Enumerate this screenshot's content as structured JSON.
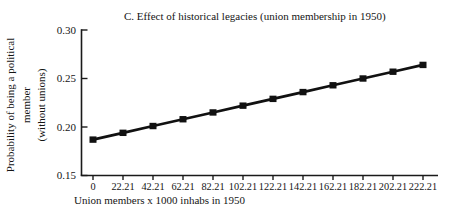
{
  "chart_data": {
    "type": "line",
    "title": "C. Effect of historical legacies (union membership in 1950)",
    "xlabel": "Union members x 1000 inhabs in 1950",
    "ylabel": "Probability of being a political member (without unions)",
    "ylabel_lines": [
      "Probability of being a political member",
      "(without unions)"
    ],
    "categories": [
      "0",
      "22.21",
      "42.21",
      "62.21",
      "82.21",
      "102.21",
      "122.21",
      "142.21",
      "162.21",
      "182.21",
      "202.21",
      "222.21"
    ],
    "values": [
      0.187,
      0.194,
      0.201,
      0.208,
      0.215,
      0.222,
      0.229,
      0.236,
      0.243,
      0.25,
      0.257,
      0.264
    ],
    "y_ticks": [
      0.15,
      0.2,
      0.25,
      0.3
    ],
    "y_tick_labels": [
      "0.15",
      "0.20",
      "0.25",
      "0.30"
    ],
    "ylim": [
      0.15,
      0.3
    ],
    "grid": false,
    "legend": "none",
    "marker": "square",
    "series_color": "#111111",
    "axis_color": "#1a1a1a",
    "text_color": "#151515",
    "background": "#ffffff"
  }
}
